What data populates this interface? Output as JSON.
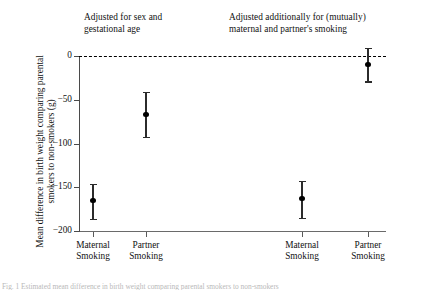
{
  "figure": {
    "y_axis_label": "Mean difference in birth weight comparing parental\nsmokers to non-smokers (g)",
    "panel_titles": {
      "left": "Adjusted for sex and\ngestational age",
      "right": "Adjusted additionally for (mutually)\nmaternal and partner's smoking"
    },
    "caption_remnant": "Fig. 1 Estimated mean difference in birth weight comparing parental smokers to non-smokers"
  },
  "chart_data": {
    "type": "scatter",
    "title": "",
    "subtitle": "",
    "xlabel": "",
    "ylabel": "Mean difference in birth weight comparing parental smokers to non-smokers (g)",
    "ylim": [
      -200,
      0
    ],
    "yticks": [
      0,
      -50,
      -100,
      -150,
      -200
    ],
    "ytick_labels": [
      "0",
      "−50",
      "−100",
      "−150",
      "−200"
    ],
    "grid": false,
    "legend": "none",
    "reference_line": {
      "value": 0,
      "style": "dashed",
      "color": "#000000"
    },
    "panels": [
      {
        "title": "Adjusted for sex and gestational age",
        "points": [
          {
            "label": "Maternal\nSmoking",
            "label_flat": "Maternal Smoking",
            "estimate": -165,
            "ci_low": -186,
            "ci_high": -146
          },
          {
            "label": "Partner\nSmoking",
            "label_flat": "Partner Smoking",
            "estimate": -67,
            "ci_low": -92,
            "ci_high": -41
          }
        ]
      },
      {
        "title": "Adjusted additionally for (mutually) maternal and partner's smoking",
        "points": [
          {
            "label": "Maternal\nSmoking",
            "label_flat": "Maternal Smoking",
            "estimate": -163,
            "ci_low": -185,
            "ci_high": -143
          },
          {
            "label": "Partner\nSmoking",
            "label_flat": "Partner Smoking",
            "estimate": -10,
            "ci_low": -29,
            "ci_high": 9
          }
        ]
      }
    ],
    "point_x_positions_px": [
      93,
      146,
      302,
      368
    ],
    "marker": {
      "shape": "circle",
      "color": "#000000"
    }
  }
}
